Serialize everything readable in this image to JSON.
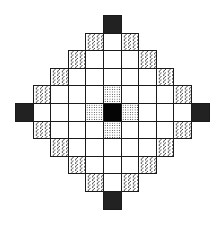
{
  "diagram": {
    "title": "",
    "grid": {
      "cols": 11,
      "rows": 11,
      "origin_x": 15,
      "origin_y": 15,
      "cell_w": 17.6,
      "cell_h": 17.6
    },
    "legend_types": {
      "dark": "dark stippled cell (diamond tip)",
      "black": "solid black center cell",
      "dotted": "light dotted cell (adjacent to center)",
      "hatched": "diagonally hatched cell (diamond edge)",
      "white": "empty white cell"
    },
    "rows": [
      [
        "-",
        "-",
        "-",
        "-",
        "-",
        "dark",
        "-",
        "-",
        "-",
        "-",
        "-"
      ],
      [
        "-",
        "-",
        "-",
        "-",
        "hatched",
        "white",
        "hatched",
        "-",
        "-",
        "-",
        "-"
      ],
      [
        "-",
        "-",
        "-",
        "hatched",
        "white",
        "white",
        "white",
        "hatched",
        "-",
        "-",
        "-"
      ],
      [
        "-",
        "-",
        "hatched",
        "white",
        "white",
        "white",
        "white",
        "white",
        "hatched",
        "-",
        "-"
      ],
      [
        "-",
        "hatched",
        "white",
        "white",
        "white",
        "dotted",
        "white",
        "white",
        "white",
        "hatched",
        "-"
      ],
      [
        "dark",
        "white",
        "white",
        "white",
        "dotted",
        "black",
        "dotted",
        "white",
        "white",
        "white",
        "dark"
      ],
      [
        "-",
        "hatched",
        "white",
        "white",
        "white",
        "dotted",
        "white",
        "white",
        "white",
        "hatched",
        "-"
      ],
      [
        "-",
        "-",
        "hatched",
        "white",
        "white",
        "white",
        "white",
        "white",
        "hatched",
        "-",
        "-"
      ],
      [
        "-",
        "-",
        "-",
        "hatched",
        "white",
        "white",
        "white",
        "hatched",
        "-",
        "-",
        "-"
      ],
      [
        "-",
        "-",
        "-",
        "-",
        "hatched",
        "white",
        "hatched",
        "-",
        "-",
        "-",
        "-"
      ],
      [
        "-",
        "-",
        "-",
        "-",
        "-",
        "dark",
        "-",
        "-",
        "-",
        "-",
        "-"
      ]
    ]
  }
}
